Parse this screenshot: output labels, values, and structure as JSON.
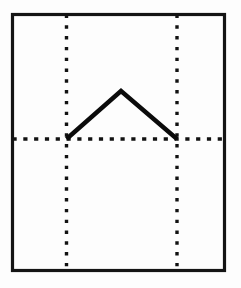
{
  "figure": {
    "title": "Chevron peak line diagram",
    "background_color": "#fdfdfd",
    "ink_color": "#111111",
    "width": 241,
    "height": 288
  },
  "frame": {
    "name": "plot-border-rectangle",
    "x": 12.5,
    "y": 14.5,
    "width": 212,
    "height": 256,
    "stroke_color": "#141414",
    "stroke_width": 3.2
  },
  "gridlines": {
    "style": "dotted",
    "stroke_color": "#121212",
    "vertical": [
      {
        "name": "gridline-vertical-left",
        "x": 66.5,
        "y_top": 14.5,
        "y_bottom": 270.5
      },
      {
        "name": "gridline-vertical-right",
        "x": 177,
        "y_top": 14.5,
        "y_bottom": 270.5
      }
    ],
    "horizontal": [
      {
        "name": "gridline-horizontal-baseline",
        "y": 139,
        "x_left": 12.5,
        "x_right": 224.5
      }
    ]
  },
  "chart_data": {
    "type": "line",
    "title": "Chevron peak line diagram",
    "xlabel": "",
    "ylabel": "",
    "x": [
      66.5,
      121,
      177
    ],
    "values": [
      139,
      91,
      139
    ],
    "points": [
      {
        "label": "left-vertex",
        "x": 66.5,
        "y": 139
      },
      {
        "label": "apex",
        "x": 121,
        "y": 91
      },
      {
        "label": "right-vertex",
        "x": 177,
        "y": 139
      }
    ],
    "series": [
      {
        "name": "chevron",
        "values": [
          139,
          91,
          139
        ]
      }
    ],
    "xlim": [
      12.5,
      224.5
    ],
    "ylim": [
      270.5,
      14.5
    ],
    "grid": true,
    "legend": "none",
    "annotations": [
      "Solid polyline forms an inverted-V (tent) shape",
      "Both endpoints rest on the horizontal dotted baseline",
      "Endpoints coincide with the two vertical dotted gridlines"
    ]
  }
}
